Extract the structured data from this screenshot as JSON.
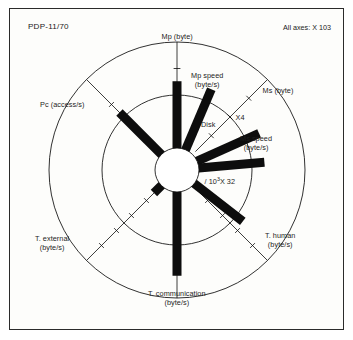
{
  "figure": {
    "title": "PDP-11/70",
    "units_note": "All axes:  X 10",
    "units_exponent": "3",
    "background": "#fdfdfb",
    "ink": "#0d0d0d"
  },
  "annotations": {
    "disk": "Disk",
    "x4": "X4",
    "div_note_pre": "/ 10",
    "div_note_sup": "3",
    "div_note_post": "X 32"
  },
  "chart_data": {
    "type": "radar",
    "title": "PDP-11/70",
    "subtitle": "All axes: X 10^3",
    "center": {
      "x": 177,
      "y": 170
    },
    "hub_radius": 22,
    "inner_circle_radius": 75,
    "outer_circle_radius": 128,
    "value_max": 1.0,
    "grid": "two concentric circles, radial spokes with tick marks",
    "legend": "none",
    "axes": [
      {
        "id": "mp-byte",
        "label": "Mp (byte)",
        "label_line2": "",
        "angle_deg": 90,
        "value": 0.63,
        "bar_width": 9,
        "spoke": true,
        "spoke_ticks": 3,
        "label_pos": {
          "x": 177,
          "y": 36
        }
      },
      {
        "id": "mp-speed",
        "label": "Mp speed",
        "label_line2": "(byte/s)",
        "angle_deg": 67,
        "value": 0.62,
        "bar_width": 9,
        "spoke": false,
        "spoke_ticks": 0,
        "label_pos": {
          "x": 207,
          "y": 80
        }
      },
      {
        "id": "ms-byte",
        "label": "Ms (byte)",
        "label_line2": "",
        "angle_deg": 45,
        "value": 0,
        "bar_width": 9,
        "spoke": true,
        "spoke_ticks": 3,
        "label_pos": {
          "x": 278,
          "y": 90
        }
      },
      {
        "id": "disk",
        "label": "Disk",
        "label_line2": "",
        "angle_deg": 24,
        "value": 0.64,
        "bar_width": 9,
        "spoke": false,
        "spoke_ticks": 0,
        "label_pos": {
          "x": 208,
          "y": 124
        }
      },
      {
        "id": "ms-speed",
        "label": "Ms speed",
        "label_line2": "(byte/s)",
        "angle_deg": 5,
        "value": 0.62,
        "bar_width": 9,
        "spoke": false,
        "spoke_ticks": 0,
        "label_pos": {
          "x": 256,
          "y": 143
        }
      },
      {
        "id": "div-10-3-x32",
        "label": "/ 10",
        "label_line2": "X 32",
        "angle_deg": -38,
        "value": 0.58,
        "bar_width": 9,
        "spoke": false,
        "spoke_ticks": 0,
        "label_pos": {
          "x": 220,
          "y": 181
        }
      },
      {
        "id": "t-human",
        "label": "T. human",
        "label_line2": "(byte/s)",
        "angle_deg": -45,
        "value": 0,
        "bar_width": 9,
        "spoke": true,
        "spoke_ticks": 4,
        "label_pos": {
          "x": 280,
          "y": 240
        }
      },
      {
        "id": "t-communication",
        "label": "T. communication",
        "label_line2": "(byte/s)",
        "angle_deg": -90,
        "value": 0.79,
        "bar_width": 9,
        "spoke": true,
        "spoke_ticks": 3,
        "label_pos": {
          "x": 177,
          "y": 298
        }
      },
      {
        "id": "t-external",
        "label": "T. external",
        "label_line2": "(byte/s)",
        "angle_deg": -135,
        "value": 0.1,
        "bar_width": 9,
        "spoke": true,
        "spoke_ticks": 4,
        "label_pos": {
          "x": 52,
          "y": 243
        }
      },
      {
        "id": "pc-access",
        "label": "Pc (access/s)",
        "label_line2": "",
        "angle_deg": 135,
        "value": 0.56,
        "bar_width": 9,
        "spoke": true,
        "spoke_ticks": 2,
        "label_pos": {
          "x": 62,
          "y": 104
        }
      }
    ]
  }
}
